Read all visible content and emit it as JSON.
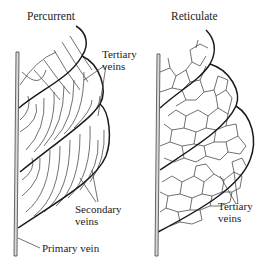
{
  "panels": [
    {
      "title": "Percurrent",
      "labels": {
        "tertiary": [
          "Tertiary",
          "veins"
        ],
        "secondary": [
          "Secondary",
          "veins"
        ],
        "primary": "Primary vein"
      }
    },
    {
      "title": "Reticulate",
      "labels": {
        "tertiary": [
          "Tertiary",
          "veins"
        ]
      }
    }
  ],
  "colors": {
    "ink": "#1a1a1a",
    "primary_vein_fill": "#d9d9d9",
    "tertiary_line": "#333333"
  }
}
